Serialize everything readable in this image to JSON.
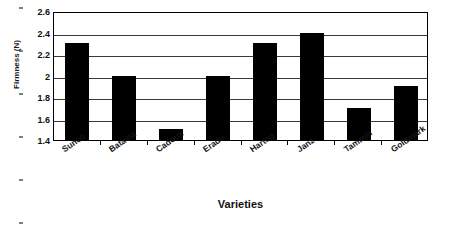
{
  "chart_data": {
    "type": "bar",
    "title": "",
    "xlabel": "Varieties",
    "ylabel": "Firmness (N)",
    "categories": [
      "Sunco",
      "Batavia",
      "Cadoux",
      "Eradu",
      "Hartog",
      "Janz",
      "Tammin",
      "Goldmark"
    ],
    "values": [
      2.3,
      2.0,
      1.5,
      2.0,
      2.3,
      2.4,
      1.7,
      1.9
    ],
    "ylim": [
      1.4,
      2.6
    ],
    "ytick_values": [
      1.4,
      1.6,
      1.8,
      2.0,
      2.2,
      2.4,
      2.6
    ],
    "ytick_labels": [
      "1.4",
      "1.6",
      "1.8",
      "2",
      "2.2",
      "2.4",
      "2.6"
    ],
    "grid": true,
    "legend": false,
    "bar_color": "#000000",
    "frame_color": "#000000",
    "gridline_color": "#3a3a3a",
    "background": "#ffffff"
  }
}
